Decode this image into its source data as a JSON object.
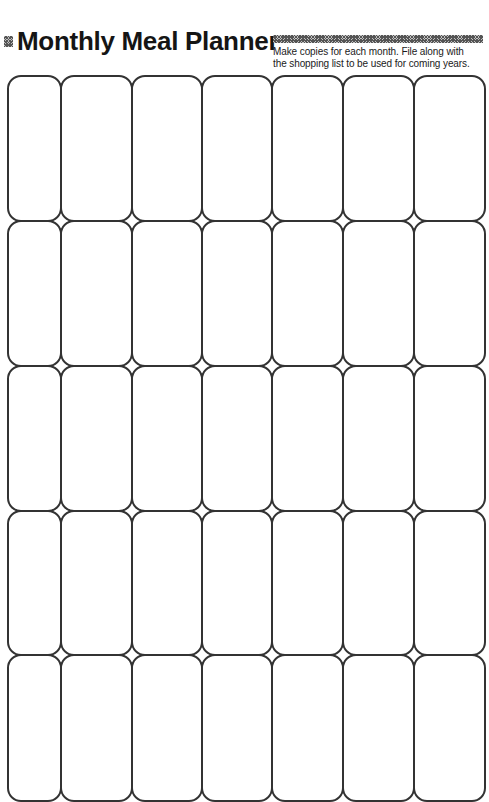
{
  "header": {
    "bullet_icon": "hatched-square-icon",
    "title": "Monthly Meal Planner",
    "decoration": "hatched-bar",
    "instructions": [
      "Make copies for each month.  File along with",
      "the shopping list to be used for coming years."
    ]
  },
  "calendar": {
    "columns": 7,
    "rows": 5,
    "column_edges": [
      7,
      60,
      131,
      201,
      271,
      342,
      413,
      484
    ],
    "row_edges": [
      75,
      220,
      365,
      510,
      654,
      800
    ],
    "cell_radius": 14,
    "stroke_color": "#333333",
    "cells_content": "empty"
  }
}
